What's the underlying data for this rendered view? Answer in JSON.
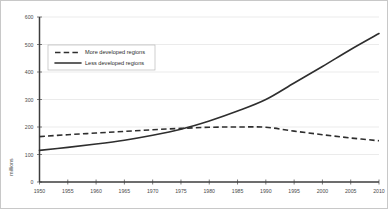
{
  "chart_data": {
    "type": "line",
    "title": "",
    "xlabel": "",
    "ylabel": "millions",
    "xlim": [
      1950,
      2010
    ],
    "ylim": [
      0,
      600
    ],
    "grid": true,
    "legend_position": "upper-left-inside",
    "x": [
      1950,
      1955,
      1960,
      1965,
      1970,
      1975,
      1980,
      1985,
      1990,
      1995,
      2000,
      2005,
      2010
    ],
    "xticks": [
      "1950",
      "1955",
      "1960",
      "1965",
      "1970",
      "1975",
      "1980",
      "1985",
      "1990",
      "1995",
      "2000",
      "2005",
      "2010"
    ],
    "yticks": [
      "0",
      "100",
      "200",
      "300",
      "400",
      "500",
      "600"
    ],
    "ytick_values": [
      0,
      100,
      200,
      300,
      400,
      500,
      600
    ],
    "series": [
      {
        "name": "More developed regions",
        "style": "dashed",
        "color": "#2e2e2e",
        "values": [
          165,
          172,
          178,
          184,
          190,
          195,
          199,
          200,
          199,
          185,
          172,
          160,
          150
        ]
      },
      {
        "name": "Less developed regions",
        "style": "solid",
        "color": "#2e2e2e",
        "values": [
          115,
          126,
          138,
          152,
          170,
          192,
          222,
          258,
          300,
          360,
          420,
          482,
          540
        ]
      }
    ],
    "annotations": []
  },
  "legend": {
    "entries": [
      {
        "label": "More developed regions",
        "style": "dashed"
      },
      {
        "label": "Less developed regions",
        "style": "solid"
      }
    ]
  },
  "colors": {
    "line": "#2e2e2e",
    "gridline": "#e2e2e2",
    "axis": "#3d3d3d",
    "tick_text": "#4a4a4a",
    "border": "#c8c8c8",
    "background": "#ffffff"
  }
}
